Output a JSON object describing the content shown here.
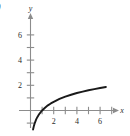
{
  "figure": {
    "part_label": ")",
    "background_color": "#ffffff",
    "axis_color": "#8c8c8c",
    "curve_color": "#1a1a1a",
    "text_color": "#2b2b2b"
  },
  "chart_data": {
    "type": "line",
    "title": "",
    "subtitle": "",
    "xlabel": "x",
    "ylabel": "y",
    "xlim": [
      -0.9,
      7.6
    ],
    "ylim": [
      -1.6,
      7.4
    ],
    "grid": false,
    "legend": null,
    "legend_position": "none",
    "x_ticks": [
      1,
      2,
      3,
      4,
      5,
      6,
      7
    ],
    "x_tick_labels": [
      "",
      "2",
      "",
      "4",
      "",
      "6",
      ""
    ],
    "y_ticks": [
      1,
      2,
      3,
      4,
      5,
      6
    ],
    "y_tick_labels": [
      "",
      "2",
      "",
      "4",
      "",
      "6"
    ],
    "series": [
      {
        "name": "y = ln(x)",
        "values": [
          [
            0.22,
            -1.51
          ],
          [
            0.25,
            -1.39
          ],
          [
            0.3,
            -1.2
          ],
          [
            0.35,
            -1.05
          ],
          [
            0.4,
            -0.92
          ],
          [
            0.45,
            -0.8
          ],
          [
            0.5,
            -0.69
          ],
          [
            0.6,
            -0.51
          ],
          [
            0.7,
            -0.36
          ],
          [
            0.8,
            -0.22
          ],
          [
            0.9,
            -0.11
          ],
          [
            1.0,
            0.0
          ],
          [
            1.25,
            0.22
          ],
          [
            1.5,
            0.41
          ],
          [
            1.75,
            0.56
          ],
          [
            2.0,
            0.69
          ],
          [
            2.5,
            0.92
          ],
          [
            3.0,
            1.1
          ],
          [
            3.5,
            1.25
          ],
          [
            4.0,
            1.39
          ],
          [
            4.5,
            1.5
          ],
          [
            5.0,
            1.61
          ],
          [
            5.5,
            1.7
          ],
          [
            6.0,
            1.79
          ],
          [
            6.5,
            1.87
          ]
        ]
      }
    ],
    "annotations": []
  },
  "labels": {
    "x_axis_name": "x",
    "y_axis_name": "y",
    "x2": "2",
    "x4": "4",
    "x6": "6",
    "y2": "2",
    "y4": "4",
    "y6": "6"
  }
}
